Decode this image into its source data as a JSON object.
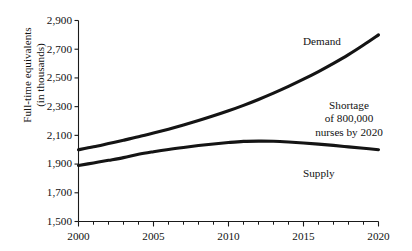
{
  "chart_data": {
    "type": "line",
    "title": "",
    "xlabel": "",
    "ylabel_line1": "Full-time equivalents",
    "ylabel_line2": "(in thousands)",
    "xlim": [
      2000,
      2020
    ],
    "ylim": [
      1500,
      2900
    ],
    "grid": false,
    "legend_position": "inline-annotations",
    "x_ticks": [
      "2000",
      "2005",
      "2010",
      "2015",
      "2020"
    ],
    "x_tick_values": [
      2000,
      2005,
      2010,
      2015,
      2020
    ],
    "x_minor_tick_interval": 1,
    "y_ticks": [
      "1,500",
      "1,700",
      "1,900",
      "2,100",
      "2,300",
      "2,500",
      "2,700",
      "2,900"
    ],
    "y_tick_values": [
      1500,
      1700,
      1900,
      2100,
      2300,
      2500,
      2700,
      2900
    ],
    "x": [
      2000,
      2001,
      2002,
      2003,
      2004,
      2005,
      2006,
      2007,
      2008,
      2009,
      2010,
      2011,
      2012,
      2013,
      2014,
      2015,
      2016,
      2017,
      2018,
      2019,
      2020
    ],
    "series": [
      {
        "name": "Demand",
        "label": "Demand",
        "color": "#141414",
        "values": [
          2000,
          2020,
          2043,
          2066,
          2090,
          2116,
          2143,
          2172,
          2203,
          2236,
          2271,
          2309,
          2350,
          2394,
          2441,
          2491,
          2544,
          2601,
          2662,
          2729,
          2800
        ]
      },
      {
        "name": "Supply",
        "label": "Supply",
        "color": "#141414",
        "values": [
          1890,
          1908,
          1926,
          1945,
          1968,
          1986,
          2002,
          2016,
          2029,
          2040,
          2050,
          2058,
          2060,
          2059,
          2054,
          2047,
          2039,
          2030,
          2020,
          2010,
          2000
        ]
      }
    ],
    "annotations": [
      {
        "name": "shortage-note",
        "lines": [
          "Shortage",
          "of 800,000",
          "nurses by 2020"
        ],
        "value": 800000,
        "year": 2020
      }
    ]
  }
}
